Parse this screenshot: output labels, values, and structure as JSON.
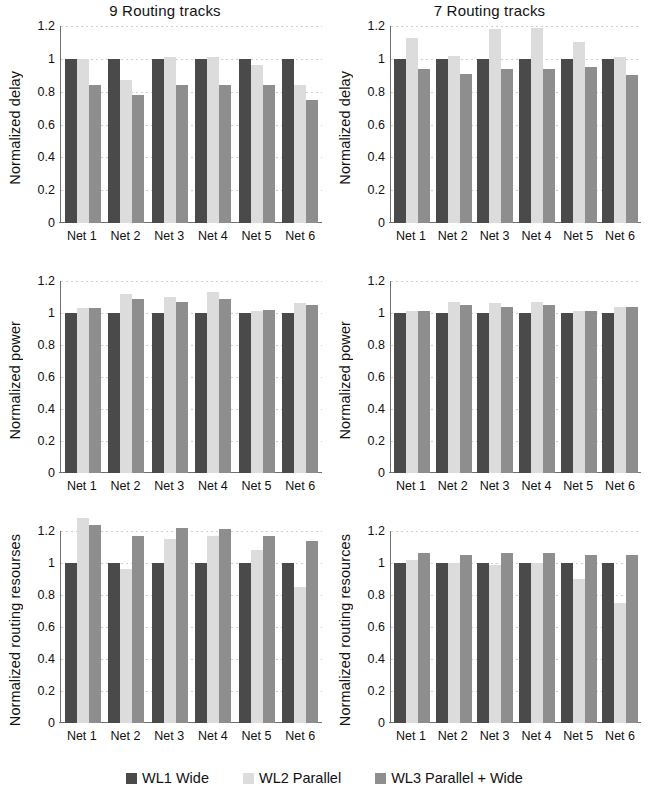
{
  "figure": {
    "columns": [
      {
        "title": "9 Routing tracks"
      },
      {
        "title": "7 Routing tracks"
      }
    ],
    "categories": [
      "Net 1",
      "Net 2",
      "Net 3",
      "Net 4",
      "Net 5",
      "Net 6"
    ],
    "yticks": [
      "1.2",
      "1",
      "0.8",
      "0.6",
      "0.4",
      "0.2",
      "0"
    ],
    "ylim": [
      0,
      1.2
    ]
  },
  "legend": {
    "items": [
      {
        "label": "WL1 Wide",
        "color": "#4a4a4a"
      },
      {
        "label": "WL2 Parallel",
        "color": "#dcdcdc"
      },
      {
        "label": "WL3 Parallel + Wide",
        "color": "#8e8e8e"
      }
    ]
  },
  "chart_data": [
    {
      "type": "bar",
      "title": "9 Routing tracks",
      "ylabel": "Normalized delay",
      "xlabel": "",
      "categories": [
        "Net 1",
        "Net 2",
        "Net 3",
        "Net 4",
        "Net 5",
        "Net 6"
      ],
      "series": [
        {
          "name": "WL1 Wide",
          "values": [
            1.0,
            1.0,
            1.0,
            1.0,
            1.0,
            1.0
          ]
        },
        {
          "name": "WL2 Parallel",
          "values": [
            1.0,
            0.87,
            1.01,
            1.01,
            0.96,
            0.84
          ]
        },
        {
          "name": "WL3 Parallel + Wide",
          "values": [
            0.84,
            0.78,
            0.84,
            0.84,
            0.84,
            0.75
          ]
        }
      ],
      "ylim": [
        0,
        1.2
      ],
      "grid": true,
      "legend_position": "bottom"
    },
    {
      "type": "bar",
      "title": "7 Routing tracks",
      "ylabel": "Normalized delay",
      "xlabel": "",
      "categories": [
        "Net 1",
        "Net 2",
        "Net 3",
        "Net 4",
        "Net 5",
        "Net 6"
      ],
      "series": [
        {
          "name": "WL1 Wide",
          "values": [
            1.0,
            1.0,
            1.0,
            1.0,
            1.0,
            1.0
          ]
        },
        {
          "name": "WL2 Parallel",
          "values": [
            1.13,
            1.02,
            1.18,
            1.19,
            1.1,
            1.01
          ]
        },
        {
          "name": "WL3 Parallel + Wide",
          "values": [
            0.94,
            0.91,
            0.94,
            0.94,
            0.95,
            0.9
          ]
        }
      ],
      "ylim": [
        0,
        1.2
      ],
      "grid": true,
      "legend_position": "bottom"
    },
    {
      "type": "bar",
      "title": "9 Routing tracks",
      "ylabel": "Normalized power",
      "xlabel": "",
      "categories": [
        "Net 1",
        "Net 2",
        "Net 3",
        "Net 4",
        "Net 5",
        "Net 6"
      ],
      "series": [
        {
          "name": "WL1 Wide",
          "values": [
            1.0,
            1.0,
            1.0,
            1.0,
            1.0,
            1.0
          ]
        },
        {
          "name": "WL2 Parallel",
          "values": [
            1.03,
            1.12,
            1.1,
            1.13,
            1.01,
            1.06
          ]
        },
        {
          "name": "WL3 Parallel + Wide",
          "values": [
            1.03,
            1.09,
            1.07,
            1.09,
            1.02,
            1.05
          ]
        }
      ],
      "ylim": [
        0,
        1.2
      ],
      "grid": true,
      "legend_position": "bottom"
    },
    {
      "type": "bar",
      "title": "7 Routing tracks",
      "ylabel": "Normalized power",
      "xlabel": "",
      "categories": [
        "Net 1",
        "Net 2",
        "Net 3",
        "Net 4",
        "Net 5",
        "Net 6"
      ],
      "series": [
        {
          "name": "WL1 Wide",
          "values": [
            1.0,
            1.0,
            1.0,
            1.0,
            1.0,
            1.0
          ]
        },
        {
          "name": "WL2 Parallel",
          "values": [
            1.01,
            1.07,
            1.06,
            1.07,
            1.01,
            1.04
          ]
        },
        {
          "name": "WL3 Parallel + Wide",
          "values": [
            1.01,
            1.05,
            1.04,
            1.05,
            1.01,
            1.04
          ]
        }
      ],
      "ylim": [
        0,
        1.2
      ],
      "grid": true,
      "legend_position": "bottom"
    },
    {
      "type": "bar",
      "title": "9 Routing tracks",
      "ylabel": "Normalized routing resourses",
      "xlabel": "",
      "categories": [
        "Net 1",
        "Net 2",
        "Net 3",
        "Net 4",
        "Net 5",
        "Net 6"
      ],
      "series": [
        {
          "name": "WL1 Wide",
          "values": [
            1.0,
            1.0,
            1.0,
            1.0,
            1.0,
            1.0
          ]
        },
        {
          "name": "WL2 Parallel",
          "values": [
            1.28,
            0.96,
            1.15,
            1.17,
            1.08,
            0.85
          ]
        },
        {
          "name": "WL3 Parallel + Wide",
          "values": [
            1.24,
            1.17,
            1.22,
            1.21,
            1.17,
            1.14
          ]
        }
      ],
      "ylim": [
        0,
        1.2
      ],
      "grid": true,
      "legend_position": "bottom"
    },
    {
      "type": "bar",
      "title": "7 Routing tracks",
      "ylabel": "Normalized routing resources",
      "xlabel": "",
      "categories": [
        "Net 1",
        "Net 2",
        "Net 3",
        "Net 4",
        "Net 5",
        "Net 6"
      ],
      "series": [
        {
          "name": "WL1 Wide",
          "values": [
            1.0,
            1.0,
            1.0,
            1.0,
            1.0,
            1.0
          ]
        },
        {
          "name": "WL2 Parallel",
          "values": [
            1.02,
            1.0,
            0.99,
            1.0,
            0.9,
            0.75
          ]
        },
        {
          "name": "WL3 Parallel + Wide",
          "values": [
            1.06,
            1.05,
            1.06,
            1.06,
            1.05,
            1.05
          ]
        }
      ],
      "ylim": [
        0,
        1.2
      ],
      "grid": true,
      "legend_position": "bottom"
    }
  ]
}
